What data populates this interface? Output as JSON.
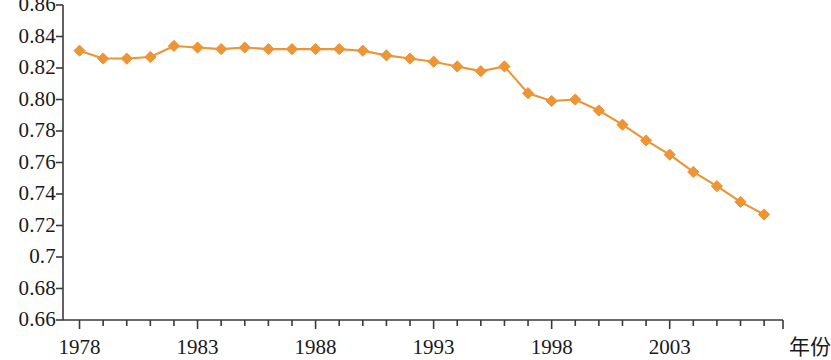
{
  "chart_data": {
    "type": "line",
    "title": "",
    "subtitle": "",
    "xlabel": "年份",
    "ylabel": "",
    "xlim": [
      1977.3,
      2007.8
    ],
    "ylim": [
      0.66,
      0.86
    ],
    "grid": false,
    "legend": false,
    "legend_position": "none",
    "marker": "diamond",
    "series_color": "#ed9434",
    "x": [
      1978,
      1979,
      1980,
      1981,
      1982,
      1983,
      1984,
      1985,
      1986,
      1987,
      1988,
      1989,
      1990,
      1991,
      1992,
      1993,
      1994,
      1995,
      1996,
      1997,
      1998,
      1999,
      2000,
      2001,
      2002,
      2003,
      2004,
      2005,
      2006,
      2007
    ],
    "values": [
      0.831,
      0.826,
      0.826,
      0.827,
      0.834,
      0.833,
      0.832,
      0.833,
      0.832,
      0.832,
      0.832,
      0.832,
      0.831,
      0.828,
      0.826,
      0.824,
      0.821,
      0.818,
      0.821,
      0.804,
      0.799,
      0.8,
      0.793,
      0.784,
      0.774,
      0.765,
      0.754,
      0.745,
      0.735,
      0.727
    ],
    "y_ticks": [
      0.86,
      0.84,
      0.82,
      0.8,
      0.78,
      0.76,
      0.74,
      0.72,
      0.7,
      0.68,
      0.66
    ],
    "y_tick_labels": [
      "0.86",
      "0.84",
      "0.82",
      "0.80",
      "0.78",
      "0.76",
      "0.74",
      "0.72",
      "0.7",
      "0.68",
      "0.66"
    ],
    "x_ticks_major": [
      1978,
      1983,
      1988,
      1993,
      1998,
      2003
    ],
    "x_tick_labels": [
      "1978",
      "1983",
      "1988",
      "1993",
      "1998",
      "2003"
    ],
    "x_minor_tick_years": [
      1979,
      1980,
      1981,
      1982,
      1984,
      1985,
      1986,
      1987,
      1989,
      1990,
      1991,
      1992,
      1994,
      1995,
      1996,
      1997,
      1999,
      2000,
      2001,
      2002,
      2004,
      2005,
      2006,
      2007
    ],
    "axis_color": "#3a3a3a",
    "text_color": "#1a1a1a"
  }
}
